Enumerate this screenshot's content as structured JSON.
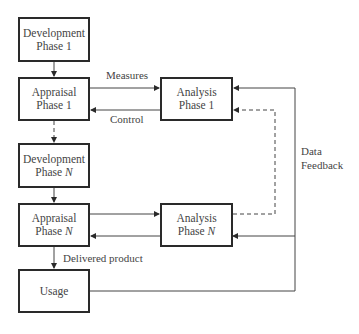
{
  "boxes": {
    "dev1": {
      "line1": "Development",
      "line2": "Phase 1"
    },
    "app1": {
      "line1": "Appraisal",
      "line2": "Phase 1"
    },
    "ana1": {
      "line1": "Analysis",
      "line2": "Phase 1"
    },
    "devN": {
      "line1": "Development",
      "line2a": "Phase ",
      "line2b": "N"
    },
    "appN": {
      "line1": "Appraisal",
      "line2a": "Phase ",
      "line2b": "N"
    },
    "anaN": {
      "line1": "Analysis",
      "line2a": "Phase ",
      "line2b": "N"
    },
    "usage": {
      "line1": "Usage"
    }
  },
  "labels": {
    "measures": "Measures",
    "control": "Control",
    "delivered": "Delivered product",
    "data": "Data",
    "feedback": "Feedback"
  },
  "colors": {
    "line": "#2a2a2a",
    "text": "#444444",
    "background": "#ffffff"
  }
}
